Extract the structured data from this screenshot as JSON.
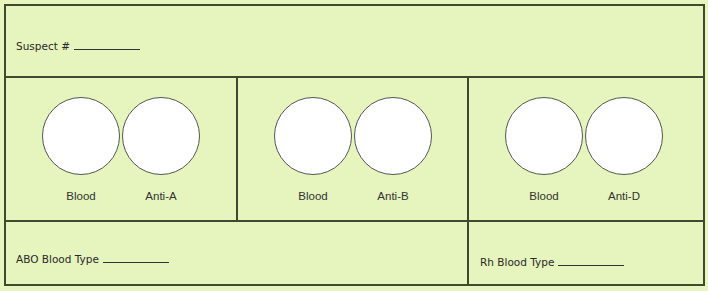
{
  "header": {
    "suspect_label": "Suspect #"
  },
  "panels": [
    {
      "left_label": "Blood",
      "right_label": "Anti-A"
    },
    {
      "left_label": "Blood",
      "right_label": "Anti-B"
    },
    {
      "left_label": "Blood",
      "right_label": "Anti-D"
    }
  ],
  "footer": {
    "abo_label": "ABO Blood Type",
    "rh_label": "Rh Blood Type"
  },
  "colors": {
    "background": "#e6f4bd",
    "border": "#3d4a2c",
    "well": "#ffffff"
  }
}
